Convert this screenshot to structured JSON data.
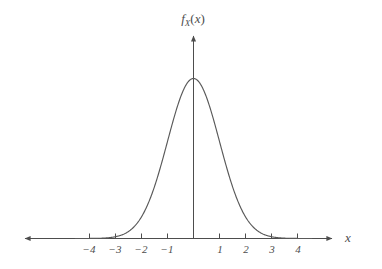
{
  "figure": {
    "background_color": "#ffffff",
    "curve_color": "#595959",
    "axis_color": "#4d4d4d",
    "text_color": "#4d4d4d"
  },
  "labels": {
    "y_axis_function": "f",
    "y_axis_subscript": "X",
    "y_axis_argument_open": "(",
    "y_axis_argument": "x",
    "y_axis_argument_close": ")",
    "x_axis": "x"
  },
  "chart_data": {
    "type": "line",
    "title": "",
    "subtitle": "",
    "xlabel": "x",
    "ylabel": "f_X(x)",
    "legend": [],
    "legend_position": "none",
    "grid": false,
    "axis_style": "arrows-both-ends-on-x, arrow-up-on-y",
    "xlim": [
      -4.9,
      4.6
    ],
    "ylim": [
      0,
      0.45
    ],
    "xticks": [
      -4,
      -3,
      -2,
      -1,
      1,
      2,
      3,
      4
    ],
    "xtick_labels": [
      "−4",
      "−3",
      "−2",
      "−1",
      "1",
      "2",
      "3",
      "4"
    ],
    "yticks": [],
    "ytick_labels": [],
    "series": [
      {
        "name": "f_X(x)",
        "description": "standard normal probability density function",
        "formula": "f_X(x) = (1/sqrt(2*pi)) * exp(-x^2/2)",
        "mean": 0,
        "std": 1,
        "peak_value": 0.3989,
        "peak_x": 0,
        "x": [
          -4.0,
          -3.75,
          -3.5,
          -3.25,
          -3.0,
          -2.75,
          -2.5,
          -2.25,
          -2.0,
          -1.75,
          -1.5,
          -1.25,
          -1.0,
          -0.75,
          -0.5,
          -0.25,
          0.0,
          0.25,
          0.5,
          0.75,
          1.0,
          1.25,
          1.5,
          1.75,
          2.0,
          2.25,
          2.5,
          2.75,
          3.0,
          3.25,
          3.5,
          3.75,
          4.0
        ],
        "y": [
          0.0001,
          0.0004,
          0.0009,
          0.002,
          0.0044,
          0.0091,
          0.0175,
          0.0317,
          0.054,
          0.0863,
          0.1295,
          0.1826,
          0.242,
          0.3011,
          0.3521,
          0.3867,
          0.3989,
          0.3867,
          0.3521,
          0.3011,
          0.242,
          0.1826,
          0.1295,
          0.0863,
          0.054,
          0.0317,
          0.0175,
          0.0091,
          0.0044,
          0.002,
          0.0009,
          0.0004,
          0.0001
        ]
      }
    ]
  }
}
